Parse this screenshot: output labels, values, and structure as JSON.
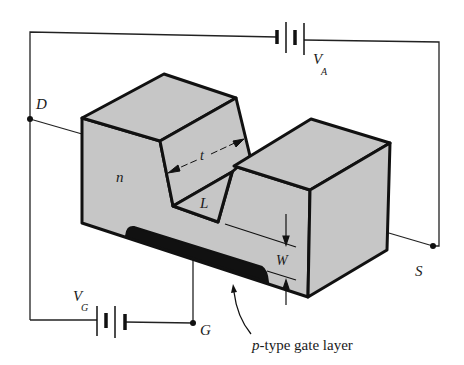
{
  "figure": {
    "colors": {
      "body_fill": "#c6c6c6",
      "edge": "#111111",
      "gate_layer": "#111111",
      "wire": "#222222",
      "background": "#ffffff"
    }
  },
  "labels": {
    "drain": "D",
    "source": "S",
    "gate": "G",
    "anode_voltage": "V",
    "anode_voltage_sub": "A",
    "gate_voltage": "V",
    "gate_voltage_sub": "G",
    "channel_type": "n",
    "thickness": "t",
    "length": "L",
    "depletion_width": "W",
    "gate_layer_prefix": "p",
    "gate_layer_rest": "-type gate layer"
  },
  "components": {
    "battery_top": {
      "name": "V_A source",
      "terminals": [
        "D",
        "S"
      ]
    },
    "battery_bottom": {
      "name": "V_G source",
      "terminals": [
        "D",
        "G"
      ]
    },
    "terminals": [
      "D",
      "S",
      "G"
    ]
  }
}
